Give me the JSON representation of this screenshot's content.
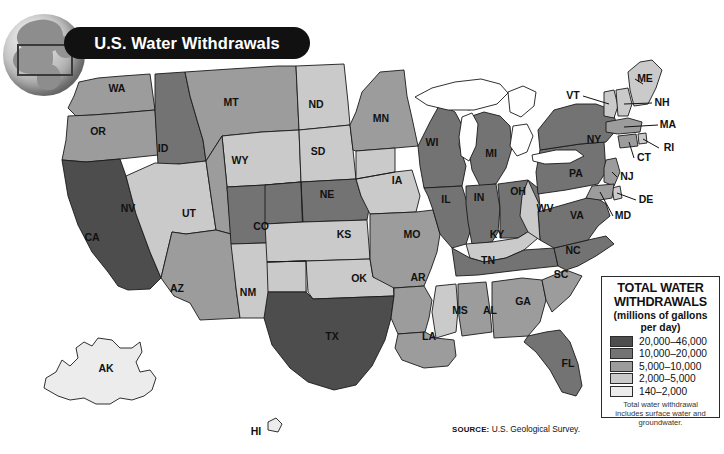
{
  "banner": {
    "title": "U.S. Water Withdrawals"
  },
  "globe": {
    "icon": "globe-north-america-icon",
    "locator_box": "locator-rectangle"
  },
  "legend": {
    "title_line1": "TOTAL WATER",
    "title_line2": "WITHDRAWALS",
    "subtitle": "(millions of gallons per day)",
    "note": "Total water withdrawal includes surface water and groundwater.",
    "classes": [
      {
        "label": "20,000–46,000",
        "color": "#4d4d4d"
      },
      {
        "label": "10,000–20,000",
        "color": "#737373"
      },
      {
        "label": "5,000–10,000",
        "color": "#9c9c9c"
      },
      {
        "label": "2,000–5,000",
        "color": "#cacaca"
      },
      {
        "label": "140–2,000",
        "color": "#ececec"
      }
    ]
  },
  "source": {
    "prefix": "SOURCE:",
    "text": "U.S. Geological Survey."
  },
  "chart_data": {
    "type": "map",
    "title": "U.S. Water Withdrawals",
    "value_unit": "millions of gallons per day",
    "classes": [
      "20,000–46,000",
      "10,000–20,000",
      "5,000–10,000",
      "2,000–5,000",
      "140–2,000"
    ],
    "class_colors": [
      "#4d4d4d",
      "#737373",
      "#9c9c9c",
      "#cacaca",
      "#ececec"
    ],
    "states": [
      {
        "code": "WA",
        "class": 2
      },
      {
        "code": "OR",
        "class": 2
      },
      {
        "code": "CA",
        "class": 0
      },
      {
        "code": "ID",
        "class": 1
      },
      {
        "code": "NV",
        "class": 3
      },
      {
        "code": "MT",
        "class": 2
      },
      {
        "code": "WY",
        "class": 3
      },
      {
        "code": "UT",
        "class": 2
      },
      {
        "code": "AZ",
        "class": 2
      },
      {
        "code": "CO",
        "class": 1
      },
      {
        "code": "NM",
        "class": 3
      },
      {
        "code": "ND",
        "class": 3
      },
      {
        "code": "SD",
        "class": 3
      },
      {
        "code": "NE",
        "class": 1
      },
      {
        "code": "KS",
        "class": 3
      },
      {
        "code": "OK",
        "class": 3
      },
      {
        "code": "TX",
        "class": 0
      },
      {
        "code": "MN",
        "class": 2
      },
      {
        "code": "IA",
        "class": 3
      },
      {
        "code": "MO",
        "class": 2
      },
      {
        "code": "AR",
        "class": 2
      },
      {
        "code": "LA",
        "class": 2
      },
      {
        "code": "WI",
        "class": 1
      },
      {
        "code": "IL",
        "class": 1
      },
      {
        "code": "MI",
        "class": 1
      },
      {
        "code": "IN",
        "class": 1
      },
      {
        "code": "OH",
        "class": 1
      },
      {
        "code": "KY",
        "class": 3
      },
      {
        "code": "TN",
        "class": 1
      },
      {
        "code": "MS",
        "class": 3
      },
      {
        "code": "AL",
        "class": 2
      },
      {
        "code": "GA",
        "class": 2
      },
      {
        "code": "FL",
        "class": 1
      },
      {
        "code": "SC",
        "class": 2
      },
      {
        "code": "NC",
        "class": 1
      },
      {
        "code": "VA",
        "class": 1
      },
      {
        "code": "WV",
        "class": 3
      },
      {
        "code": "PA",
        "class": 1
      },
      {
        "code": "NY",
        "class": 1
      },
      {
        "code": "VT",
        "class": 3
      },
      {
        "code": "NH",
        "class": 3
      },
      {
        "code": "ME",
        "class": 3
      },
      {
        "code": "MA",
        "class": 2
      },
      {
        "code": "RI",
        "class": 3
      },
      {
        "code": "CT",
        "class": 2
      },
      {
        "code": "NJ",
        "class": 2
      },
      {
        "code": "DE",
        "class": 3
      },
      {
        "code": "MD",
        "class": 2
      },
      {
        "code": "AK",
        "class": 4
      },
      {
        "code": "HI",
        "class": 4
      }
    ],
    "labels": [
      {
        "code": "WA",
        "x": 117,
        "y": 89
      },
      {
        "code": "OR",
        "x": 98,
        "y": 132
      },
      {
        "code": "CA",
        "x": 92,
        "y": 238
      },
      {
        "code": "ID",
        "x": 163,
        "y": 149
      },
      {
        "code": "NV",
        "x": 128,
        "y": 209
      },
      {
        "code": "MT",
        "x": 231,
        "y": 103
      },
      {
        "code": "WY",
        "x": 240,
        "y": 161
      },
      {
        "code": "UT",
        "x": 189,
        "y": 214
      },
      {
        "code": "AZ",
        "x": 177,
        "y": 289
      },
      {
        "code": "CO",
        "x": 261,
        "y": 227
      },
      {
        "code": "NM",
        "x": 248,
        "y": 293
      },
      {
        "code": "ND",
        "x": 316,
        "y": 105
      },
      {
        "code": "SD",
        "x": 318,
        "y": 152
      },
      {
        "code": "NE",
        "x": 327,
        "y": 195
      },
      {
        "code": "KS",
        "x": 344,
        "y": 235
      },
      {
        "code": "OK",
        "x": 359,
        "y": 279
      },
      {
        "code": "TX",
        "x": 332,
        "y": 337
      },
      {
        "code": "MN",
        "x": 381,
        "y": 119
      },
      {
        "code": "IA",
        "x": 397,
        "y": 181
      },
      {
        "code": "MO",
        "x": 412,
        "y": 235
      },
      {
        "code": "AR",
        "x": 418,
        "y": 278
      },
      {
        "code": "LA",
        "x": 429,
        "y": 337
      },
      {
        "code": "WI",
        "x": 432,
        "y": 143
      },
      {
        "code": "IL",
        "x": 446,
        "y": 200
      },
      {
        "code": "MI",
        "x": 491,
        "y": 154
      },
      {
        "code": "IN",
        "x": 479,
        "y": 198
      },
      {
        "code": "OH",
        "x": 518,
        "y": 192
      },
      {
        "code": "KY",
        "x": 497,
        "y": 235
      },
      {
        "code": "TN",
        "x": 488,
        "y": 261
      },
      {
        "code": "MS",
        "x": 460,
        "y": 311
      },
      {
        "code": "AL",
        "x": 490,
        "y": 311
      },
      {
        "code": "GA",
        "x": 523,
        "y": 302
      },
      {
        "code": "FL",
        "x": 568,
        "y": 364
      },
      {
        "code": "SC",
        "x": 561,
        "y": 275
      },
      {
        "code": "NC",
        "x": 573,
        "y": 251
      },
      {
        "code": "VA",
        "x": 577,
        "y": 216
      },
      {
        "code": "WV",
        "x": 545,
        "y": 209
      },
      {
        "code": "PA",
        "x": 576,
        "y": 174
      },
      {
        "code": "NY",
        "x": 594,
        "y": 140
      },
      {
        "code": "AK",
        "x": 106,
        "y": 369
      },
      {
        "code": "HI",
        "x": 256,
        "y": 432
      }
    ],
    "callout_labels": [
      {
        "code": "VT",
        "x": 573,
        "y": 96
      },
      {
        "code": "NH",
        "x": 662,
        "y": 103
      },
      {
        "code": "ME",
        "x": 645,
        "y": 79
      },
      {
        "code": "MA",
        "x": 668,
        "y": 125
      },
      {
        "code": "RI",
        "x": 669,
        "y": 148
      },
      {
        "code": "CT",
        "x": 644,
        "y": 158
      },
      {
        "code": "NJ",
        "x": 627,
        "y": 177
      },
      {
        "code": "DE",
        "x": 646,
        "y": 200
      },
      {
        "code": "MD",
        "x": 623,
        "y": 216
      }
    ]
  }
}
